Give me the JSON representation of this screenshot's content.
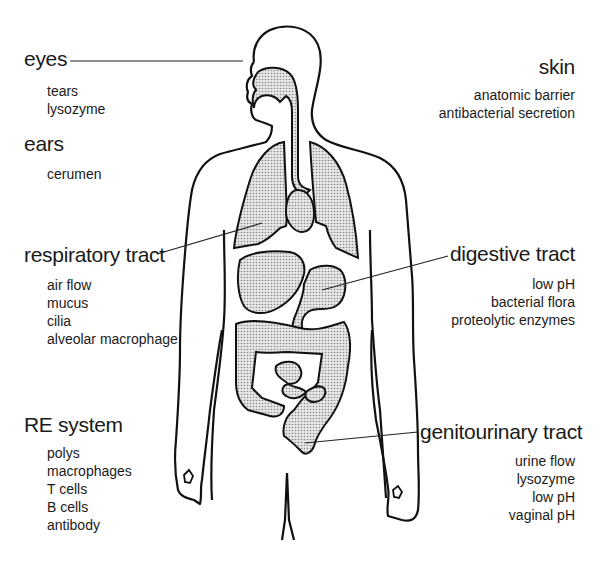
{
  "diagram": {
    "colors": {
      "line": "#111111",
      "organ_fill": "#cfcfcf",
      "background": "#ffffff"
    },
    "labels": {
      "eyes": {
        "title": "eyes",
        "items": [
          "tears",
          "lysozyme"
        ]
      },
      "ears": {
        "title": "ears",
        "items": [
          "cerumen"
        ]
      },
      "skin": {
        "title": "skin",
        "items": [
          "anatomic barrier",
          "antibacterial secretion"
        ]
      },
      "respiratory": {
        "title": "respiratory tract",
        "items": [
          "air flow",
          "mucus",
          "cilia",
          "alveolar macrophage"
        ]
      },
      "digestive": {
        "title": "digestive tract",
        "items": [
          "low pH",
          "bacterial flora",
          "proteolytic enzymes"
        ]
      },
      "re_system": {
        "title": "RE system",
        "items": [
          "polys",
          "macrophages",
          "T cells",
          "B cells",
          "antibody"
        ]
      },
      "genitourinary": {
        "title": "genitourinary tract",
        "items": [
          "urine flow",
          "lysozyme",
          "low pH",
          "vaginal pH"
        ]
      }
    }
  }
}
